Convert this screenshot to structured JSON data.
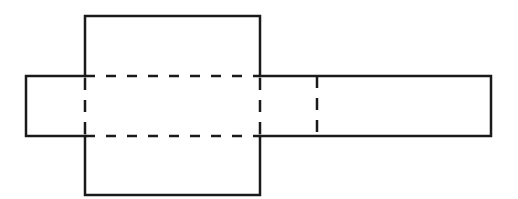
{
  "diagram": {
    "stroke_color": "#1a1a1a",
    "background": "#ffffff",
    "shapes": {
      "center_square": {
        "x1": 85,
        "y1": 16,
        "x2": 260,
        "y2": 195
      },
      "horizontal_strip": {
        "x1": 26,
        "y1": 76,
        "x2": 491,
        "y2": 136
      },
      "fold_lines": [
        {
          "type": "dashed",
          "x1": 85,
          "y1": 76,
          "x2": 260,
          "y2": 76
        },
        {
          "type": "dashed",
          "x1": 85,
          "y1": 136,
          "x2": 260,
          "y2": 136
        },
        {
          "type": "dashed",
          "x1": 85,
          "y1": 76,
          "x2": 85,
          "y2": 136
        },
        {
          "type": "dashed",
          "x1": 260,
          "y1": 76,
          "x2": 260,
          "y2": 136
        },
        {
          "type": "dashed",
          "x1": 317,
          "y1": 76,
          "x2": 317,
          "y2": 136
        }
      ]
    }
  }
}
